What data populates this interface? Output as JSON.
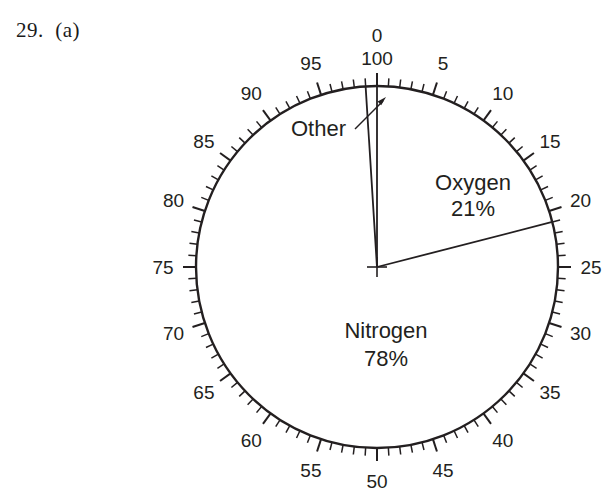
{
  "figure": {
    "problem_label": "29.  (a)",
    "caption": ""
  },
  "chart_data": {
    "type": "pie",
    "title": "",
    "xlabel": "",
    "ylabel": "",
    "units": "percent",
    "labels": [
      "Oxygen",
      "Nitrogen",
      "Other"
    ],
    "values": [
      21,
      78,
      1
    ],
    "value_labels": [
      "21%",
      "78%",
      "1%"
    ],
    "slices": [
      {
        "name": "Oxygen",
        "value": 21,
        "value_text": "21%",
        "start_pct": 0,
        "end_pct": 21,
        "label_visible": true,
        "label_text": "Oxygen",
        "pct_text": "21%"
      },
      {
        "name": "Nitrogen",
        "value": 78,
        "value_text": "78%",
        "start_pct": 21,
        "end_pct": 99,
        "label_visible": true,
        "label_text": "Nitrogen",
        "pct_text": "78%"
      },
      {
        "name": "Other",
        "value": 1,
        "value_text": "",
        "start_pct": 99,
        "end_pct": 100,
        "label_visible": true,
        "label_text": "Other",
        "pct_text": ""
      }
    ],
    "legend_position": "inside-slices",
    "grid": false,
    "scale": {
      "kind": "percentage-circle",
      "min": 0,
      "max": 100,
      "zero_at": "top",
      "direction": "clockwise",
      "major_tick_every": 5,
      "minor_tick_every": 1,
      "top_labels": [
        "0",
        "100"
      ],
      "tick_labels": [
        "0",
        "5",
        "10",
        "15",
        "20",
        "25",
        "30",
        "35",
        "40",
        "45",
        "50",
        "55",
        "60",
        "65",
        "70",
        "75",
        "80",
        "85",
        "90",
        "95"
      ]
    },
    "colors": {
      "stroke": "#231f20",
      "fill": "#ffffff",
      "background": "#ffffff"
    },
    "annotations": [
      {
        "name": "other-callout",
        "text": "Other",
        "points_to_pct": 99.5,
        "arrow": true
      }
    ]
  }
}
